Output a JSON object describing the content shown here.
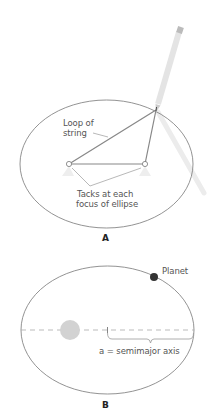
{
  "panel_a": {
    "label": "A",
    "string_label_line1": "Loop of",
    "string_label_line2": "string",
    "tacks_label_line1": "Tacks at each",
    "tacks_label_line2": "focus of ellipse"
  },
  "panel_b": {
    "label": "B",
    "planet_label": "Planet",
    "axis_label": "a = semimajor axis"
  },
  "colors": {
    "ellipse_stroke": "#666666",
    "string": "#888888",
    "pencil": "#e6e6e6",
    "sun": "#cccccc",
    "planet": "#333333",
    "dashed_axis": "#aaaaaa"
  }
}
